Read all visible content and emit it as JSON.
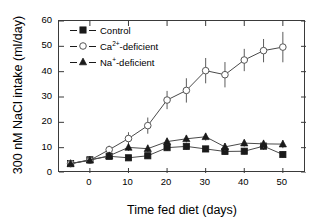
{
  "chart_data": {
    "type": "line",
    "title": "",
    "xlabel": "Time fed diet (days)",
    "ylabel": "300 nM NaCl intake (ml/day)",
    "xlim": [
      -8,
      56
    ],
    "ylim": [
      0,
      60
    ],
    "xticks": [
      0,
      10,
      20,
      30,
      40,
      50
    ],
    "yticks": [
      0,
      10,
      20,
      30,
      40,
      50,
      60
    ],
    "xtick_labels": [
      "0",
      "10",
      "20",
      "30",
      "40",
      "50"
    ],
    "ytick_labels": [
      "0",
      "10",
      "20",
      "30",
      "40",
      "50",
      "60"
    ],
    "grid": false,
    "legend_position": "top-left",
    "x": [
      -5,
      0,
      5,
      10,
      15,
      20,
      25,
      30,
      35,
      40,
      45,
      50
    ],
    "series": [
      {
        "name": "Control",
        "marker": "filled-square",
        "values": [
          3.7,
          5.2,
          6.6,
          6.0,
          6.8,
          10.0,
          10.5,
          9.5,
          8.5,
          8.6,
          10.6,
          7.3
        ],
        "errors": [
          0.5,
          0.8,
          1.2,
          1.0,
          1.1,
          1.3,
          1.3,
          1.2,
          1.3,
          1.3,
          1.5,
          1.3
        ]
      },
      {
        "name": "Ca2+-deficient",
        "name_base": "Ca",
        "name_sup": "2+",
        "name_suffix": "-deficient",
        "marker": "open-circle",
        "values": [
          3.7,
          5.0,
          9.2,
          13.6,
          18.7,
          28.8,
          32.6,
          40.4,
          38.8,
          44.6,
          48.3,
          49.7
        ],
        "errors": [
          0.5,
          0.9,
          1.6,
          2.5,
          3.2,
          3.6,
          4.8,
          5.0,
          5.0,
          4.4,
          4.6,
          6.0
        ]
      },
      {
        "name": "Na+-deficient",
        "name_base": "Na",
        "name_sup": "+",
        "name_suffix": "-deficient",
        "marker": "filled-triangle",
        "values": [
          3.7,
          5.1,
          6.8,
          10.1,
          9.6,
          12.4,
          13.5,
          14.3,
          10.3,
          11.8,
          11.5,
          11.4
        ],
        "errors": [
          0.5,
          0.8,
          1.2,
          1.4,
          1.5,
          1.4,
          1.4,
          1.5,
          1.5,
          1.4,
          1.6,
          1.6
        ]
      }
    ]
  },
  "legend": {
    "items": [
      {
        "label": "Control",
        "sup": "",
        "suffix": ""
      },
      {
        "label": "Ca",
        "sup": "2+",
        "suffix": "-deficient"
      },
      {
        "label": "Na",
        "sup": "+",
        "suffix": "-deficient"
      }
    ]
  },
  "axes": {
    "x_title": "Time fed diet (days)",
    "y_title": "300 nM NaCl intake (ml/day)"
  },
  "colors": {
    "axis": "#3a3a3a",
    "line": "#4a4a4a",
    "marker_fill": "#1a1a1a",
    "marker_open": "#ffffff",
    "background": "#ffffff",
    "text": "#000000"
  }
}
